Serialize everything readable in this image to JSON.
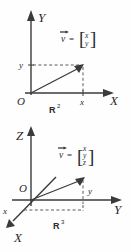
{
  "figure": {
    "name": "vector-representation-figure",
    "background_color": "#fefefe",
    "ink_color": "#3a3a3a"
  },
  "panel_2d": {
    "name": "two-dimensional-vector-diagram",
    "space_label": "R",
    "space_exponent": "2",
    "axis_vertical_label": "Y",
    "axis_horizontal_label": "X",
    "origin_label": "O",
    "tick_vertical_label": "y",
    "tick_horizontal_label": "x",
    "vector_symbol": "v",
    "equals": "=",
    "bracket_open": "[",
    "bracket_close": "]",
    "vector_components": [
      "x",
      "y"
    ]
  },
  "panel_3d": {
    "name": "three-dimensional-vector-diagram",
    "space_label": "R",
    "space_exponent": "3",
    "axis_vertical_label": "Z",
    "axis_horizontal_label": "Y",
    "axis_depth_label": "X",
    "origin_label": "O",
    "tick_depth_label": "x",
    "tick_horizontal_label": "y",
    "vector_symbol": "v",
    "equals": "=",
    "bracket_open": "[",
    "bracket_close": "]",
    "vector_components": [
      "x",
      "y",
      "z"
    ]
  }
}
